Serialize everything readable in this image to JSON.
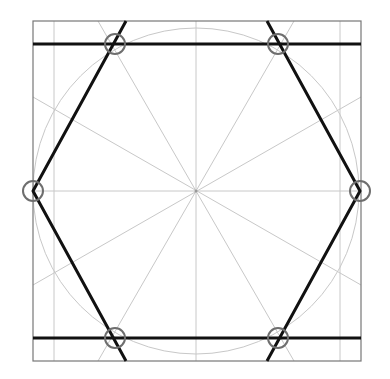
{
  "diagram": {
    "colors": {
      "background": "#ffffff",
      "construction": "#c8c8c8",
      "frame": "#777777",
      "hexagon": "#111111",
      "markers": "#6e6e6e"
    },
    "center": [
      196,
      191
    ],
    "circle_radius": 163,
    "square": {
      "x": 33,
      "y": 21,
      "w": 328,
      "h": 340
    },
    "inner_verticals": [
      54,
      340
    ],
    "hexagon_vertices": [
      [
        33,
        191
      ],
      [
        115,
        44
      ],
      [
        278,
        44
      ],
      [
        360,
        191
      ],
      [
        278,
        338
      ],
      [
        115,
        338
      ]
    ],
    "horizontal_lines_y": [
      44,
      338
    ],
    "marker_points": [
      [
        115,
        44
      ],
      [
        278,
        44
      ],
      [
        360,
        191
      ],
      [
        278,
        338
      ],
      [
        115,
        338
      ],
      [
        33,
        191
      ]
    ],
    "marker_radius": 10
  }
}
